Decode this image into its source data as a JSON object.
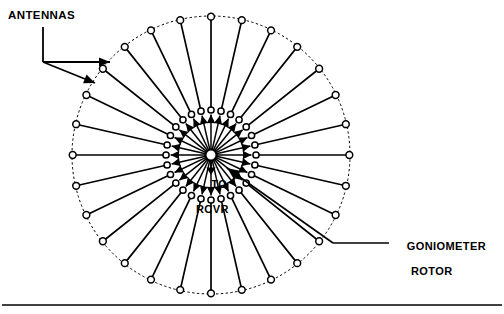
{
  "figure": {
    "type": "technical-line-diagram",
    "background_color": "#ffffff",
    "line_color": "#000000"
  },
  "labels": {
    "antennas": "ANTENNAS",
    "goniometer_line1": "GONIOMETER",
    "goniometer_line2": "ROTOR",
    "to_rcvr_line1": "TO",
    "to_rcvr_line2": "RCVR"
  },
  "geometry": {
    "center_x": 211,
    "center_y": 155,
    "outer_radius": 139,
    "inner_radius": 45,
    "antenna_count": 28,
    "start_angle_deg": -90,
    "hub_radius": 5.5,
    "node_radius": 3.4,
    "outer_circle_style": "dotted",
    "spoke_style": "solid"
  },
  "leaders": {
    "antennas": {
      "stem": [
        [
          43,
          27
        ],
        [
          43,
          62
        ]
      ],
      "arrow_upper": [
        [
          43,
          62
        ],
        [
          110,
          62
        ]
      ],
      "arrow_lower": [
        [
          43,
          62
        ],
        [
          95,
          83
        ]
      ]
    },
    "goniometer": {
      "horizontal": [
        [
          389,
          243
        ],
        [
          333,
          243
        ]
      ],
      "diagonal": [
        [
          333,
          243
        ],
        [
          227,
          168
        ]
      ]
    },
    "to_rcvr_arrow": [
      [
        211,
        161
      ],
      [
        211,
        175
      ]
    ]
  },
  "footer_rule": {
    "y": 305,
    "x1": 2,
    "x2": 502,
    "thickness": 1.4
  }
}
